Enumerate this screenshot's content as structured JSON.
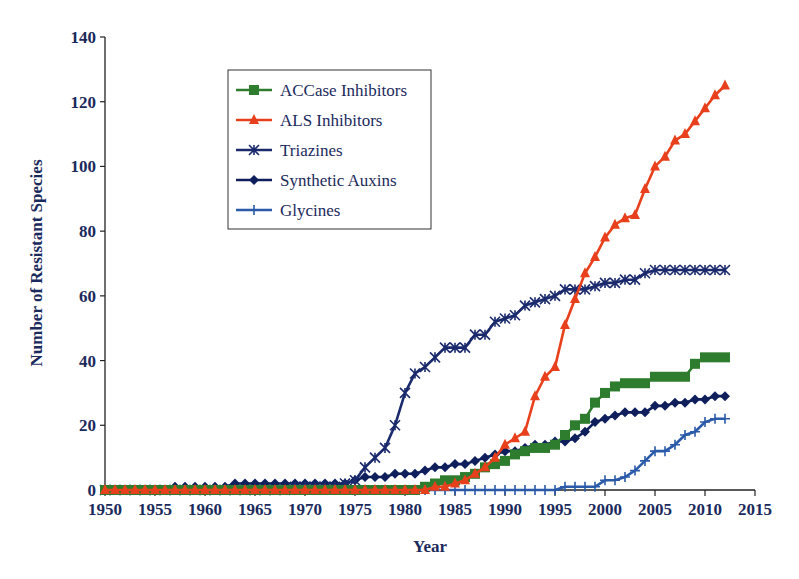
{
  "chart_data": {
    "type": "line",
    "title": "",
    "xlabel": "Year",
    "ylabel": "Number of Resistant Species",
    "xlim": [
      1950,
      2015
    ],
    "ylim": [
      0,
      140
    ],
    "x_ticks": [
      1950,
      1955,
      1960,
      1965,
      1970,
      1975,
      1980,
      1985,
      1990,
      1995,
      2000,
      2005,
      2010,
      2015
    ],
    "y_ticks": [
      0,
      20,
      40,
      60,
      80,
      100,
      120,
      140
    ],
    "grid": false,
    "legend_position": "upper-left-inset",
    "x": [
      1950,
      1951,
      1952,
      1953,
      1954,
      1955,
      1956,
      1957,
      1958,
      1959,
      1960,
      1961,
      1962,
      1963,
      1964,
      1965,
      1966,
      1967,
      1968,
      1969,
      1970,
      1971,
      1972,
      1973,
      1974,
      1975,
      1976,
      1977,
      1978,
      1979,
      1980,
      1981,
      1982,
      1983,
      1984,
      1985,
      1986,
      1987,
      1988,
      1989,
      1990,
      1991,
      1992,
      1993,
      1994,
      1995,
      1996,
      1997,
      1998,
      1999,
      2000,
      2001,
      2002,
      2003,
      2004,
      2005,
      2006,
      2007,
      2008,
      2009,
      2010,
      2011,
      2012
    ],
    "series": [
      {
        "name": "ACCase Inhibitors",
        "color": "#2e7d2e",
        "marker": "square",
        "values": [
          0,
          0,
          0,
          0,
          0,
          0,
          0,
          0,
          0,
          0,
          0,
          0,
          0,
          0,
          0,
          0,
          0,
          0,
          0,
          0,
          0,
          0,
          0,
          0,
          0,
          0,
          0,
          0,
          0,
          0,
          0,
          0,
          1,
          2,
          3,
          3,
          4,
          5,
          7,
          8,
          9,
          11,
          12,
          13,
          13,
          14,
          17,
          20,
          22,
          27,
          30,
          32,
          33,
          33,
          33,
          35,
          35,
          35,
          35,
          39,
          41,
          41,
          41
        ]
      },
      {
        "name": "ALS Inhibitors",
        "color": "#e8401c",
        "marker": "triangle",
        "values": [
          0,
          0,
          0,
          0,
          0,
          0,
          0,
          0,
          0,
          0,
          0,
          0,
          0,
          0,
          0,
          0,
          0,
          0,
          0,
          0,
          0,
          0,
          0,
          0,
          0,
          0,
          0,
          0,
          0,
          0,
          0,
          0,
          0,
          1,
          1,
          2,
          3,
          5,
          7,
          10,
          14,
          16,
          18,
          29,
          35,
          38,
          51,
          59,
          67,
          72,
          78,
          82,
          84,
          85,
          93,
          100,
          103,
          108,
          110,
          114,
          118,
          122,
          125
        ]
      },
      {
        "name": "Triazines",
        "color": "#1a2a6c",
        "marker": "asterisk",
        "values": [
          0,
          0,
          0,
          0,
          0,
          0,
          0,
          0,
          0,
          0,
          0,
          0,
          0,
          0,
          0,
          0,
          0,
          0,
          0,
          1,
          1,
          1,
          1,
          1,
          2,
          3,
          7,
          10,
          13,
          20,
          30,
          36,
          38,
          41,
          44,
          44,
          44,
          48,
          48,
          52,
          53,
          54,
          57,
          58,
          59,
          60,
          62,
          62,
          62,
          63,
          64,
          64,
          65,
          65,
          67,
          68,
          68,
          68,
          68,
          68,
          68,
          68,
          68
        ]
      },
      {
        "name": "Synthetic Auxins",
        "color": "#0f1f5c",
        "marker": "diamond",
        "values": [
          0,
          0,
          0,
          0,
          0,
          0,
          0,
          1,
          1,
          1,
          1,
          1,
          1,
          2,
          2,
          2,
          2,
          2,
          2,
          2,
          2,
          2,
          2,
          2,
          2,
          3,
          4,
          4,
          4,
          5,
          5,
          5,
          6,
          7,
          7,
          8,
          8,
          9,
          10,
          11,
          12,
          12,
          13,
          14,
          14,
          15,
          15,
          16,
          18,
          21,
          22,
          23,
          24,
          24,
          24,
          26,
          26,
          27,
          27,
          28,
          28,
          29,
          29
        ]
      },
      {
        "name": "Glycines",
        "color": "#2a5aa8",
        "marker": "plus",
        "values": [
          0,
          0,
          0,
          0,
          0,
          0,
          0,
          0,
          0,
          0,
          0,
          0,
          0,
          0,
          0,
          0,
          0,
          0,
          0,
          0,
          0,
          0,
          0,
          0,
          0,
          0,
          0,
          0,
          0,
          0,
          0,
          0,
          0,
          0,
          0,
          0,
          0,
          0,
          0,
          0,
          0,
          0,
          0,
          0,
          0,
          0,
          1,
          1,
          1,
          1,
          3,
          3,
          4,
          6,
          9,
          12,
          12,
          14,
          17,
          18,
          21,
          22,
          22
        ]
      }
    ]
  }
}
